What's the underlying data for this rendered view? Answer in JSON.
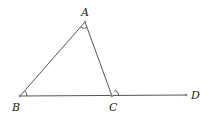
{
  "figure": {
    "type": "triangle with extended side",
    "points": {
      "A": {
        "label": "A",
        "x": 85,
        "y": 22
      },
      "B": {
        "label": "B",
        "x": 20,
        "y": 96
      },
      "C": {
        "label": "C",
        "x": 112,
        "y": 96
      },
      "D": {
        "label": "D",
        "x": 186,
        "y": 95
      }
    },
    "segments": [
      "AB",
      "AC",
      "BD"
    ],
    "angle_marks": [
      "angle-A",
      "angle-B",
      "angle-ACD"
    ],
    "colors": {
      "line": "#555555",
      "label": "#222222"
    }
  }
}
